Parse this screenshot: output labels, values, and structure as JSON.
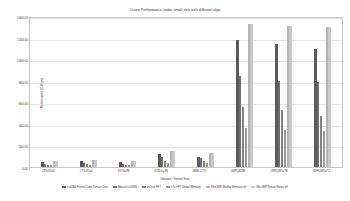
{
  "chart_data": {
    "type": "bar",
    "title": "Crane Performance under small size with different algo",
    "xlabel": "Dataset - Kernel Size",
    "ylabel": "Performance (GFlops)",
    "grid": true,
    "legend_position": "bottom",
    "ylim": [
      0,
      1400
    ],
    "yticks": [
      0,
      200,
      400,
      600,
      800,
      1000,
      1200,
      1400
    ],
    "ytick_labels": [
      "0.00",
      "200.00",
      "400.00",
      "600.00",
      "800.00",
      "1000.00",
      "1200.00",
      "1400.00"
    ],
    "categories": [
      "CTS-K3x3",
      "CTS-K5x5",
      "K3-Nx3N",
      "K5N-Lg3N",
      "MNK-CT3",
      "LWFQW3M",
      "LWFQW5x7N",
      "LWFQW3x7-2"
    ],
    "series": [
      {
        "name": "cuDNN Fused Conv-Tensor Core",
        "color": "#5a5a5a",
        "values": [
          44,
          52,
          42,
          118,
          92,
          1180,
          1140,
          1090
        ]
      },
      {
        "name": "Manual cuDNN",
        "color": "#6e6e6e",
        "values": [
          30,
          36,
          28,
          96,
          80,
          840,
          800,
          790
        ]
      },
      {
        "name": "im2col-FFT",
        "color": "#828282",
        "values": [
          22,
          26,
          20,
          60,
          52,
          560,
          530,
          470
        ]
      },
      {
        "name": "cTe-FFT Global Memory",
        "color": "#9a9a9a",
        "values": [
          16,
          20,
          15,
          40,
          36,
          360,
          340,
          330
        ]
      },
      {
        "name": "Win-IMP Shalloy Memory ref",
        "color": "#b4b4b4",
        "values": [
          60,
          66,
          58,
          150,
          128,
          1330,
          1310,
          1300
        ]
      },
      {
        "name": "Win-IMP Tensor Matrix ref",
        "color": "#cacaca",
        "values": [
          58,
          64,
          56,
          148,
          126,
          1330,
          1310,
          1300
        ]
      }
    ]
  }
}
